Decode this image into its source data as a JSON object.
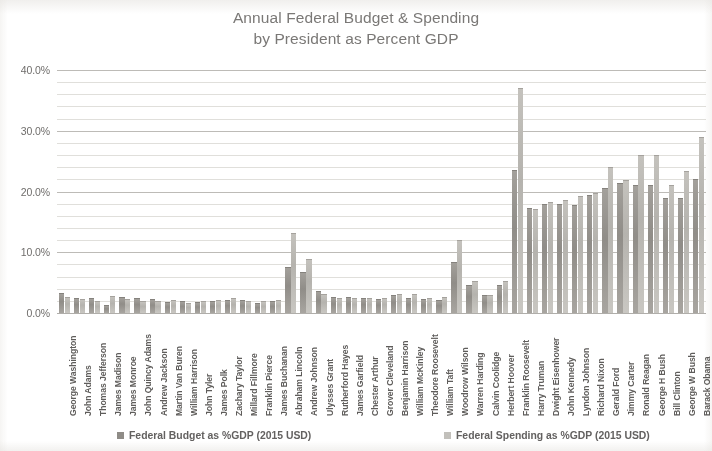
{
  "title": {
    "line1": "Annual Federal Budget & Spending",
    "line2": "by  President as Percent GDP"
  },
  "legend": {
    "budget_label": "Federal Budget as %GDP (2015 USD)",
    "spending_label": "Federal Spending as %GDP (2015 USD)"
  },
  "axis": {
    "y_ticks": [
      "0.0%",
      "10.0%",
      "20.0%",
      "30.0%",
      "40.0%"
    ]
  },
  "colors": {
    "budget_bar": "#908d88",
    "spending_bar": "#c2c0bb",
    "gridline": "#c9c7c3",
    "text": "#6e6e6e"
  },
  "chart_data": {
    "type": "bar",
    "title": "Annual Federal Budget & Spending by  President as Percent GDP",
    "xlabel": "",
    "ylabel": "",
    "ylim": [
      0,
      40
    ],
    "ytick_interval": 10,
    "minor_gridline_interval": 2,
    "grid": true,
    "legend_position": "bottom",
    "value_unit": "percent",
    "categories": [
      "George Washington",
      "John Adams",
      "Thomas Jefferson",
      "James Madison",
      "James Monroe",
      "John Quincy Adams",
      "Andrew Jackson",
      "Martin Van Buren",
      "William Harrison",
      "John Tyler",
      "James Polk",
      "Zachary Taylor",
      "Millard Fillmore",
      "Franklin Pierce",
      "James Buchanan",
      "Abraham Lincoln",
      "Andrew Johnson",
      "Ulysses Grant",
      "Rutherford Hayes",
      "James Garfield",
      "Chester Arthur",
      "Grover Cleveland",
      "Benjamin Harrison",
      "William McKinley",
      "Theodore Roosevelt",
      "William Taft",
      "Woodrow Wilson",
      "Warren Harding",
      "Calvin Coolidge",
      "Herbert Hoover",
      "Franklin Roosevelt",
      "Harry Truman",
      "Dwight Eisenhower",
      "John Kennedy",
      "Lyndon Johnson",
      "Richard Nixon",
      "Gerald Ford",
      "Jimmy Carter",
      "Ronald Reagan",
      "George H Bush",
      "Bill Clinton",
      "George W Bush",
      "Barack Obama"
    ],
    "series": [
      {
        "name": "Federal Budget as %GDP (2015 USD)",
        "values": [
          3.3,
          2.4,
          2.4,
          1.4,
          2.6,
          2.4,
          2.3,
          1.8,
          2.0,
          1.8,
          1.9,
          2.1,
          2.1,
          1.6,
          1.9,
          7.5,
          6.8,
          3.6,
          2.7,
          2.6,
          2.5,
          2.3,
          2.9,
          2.5,
          2.3,
          2.2,
          8.4,
          4.6,
          3.0,
          4.6,
          23.5,
          17.3,
          18.0,
          17.9,
          17.8,
          19.5,
          20.5,
          21.4,
          21.0,
          21.1,
          18.9,
          18.9,
          22.0
        ]
      },
      {
        "name": "Federal Spending as %GDP (2015 USD)",
        "values": [
          2.6,
          2.3,
          1.9,
          2.8,
          2.3,
          2.0,
          1.9,
          2.1,
          1.7,
          2.0,
          2.1,
          2.4,
          1.9,
          1.9,
          2.2,
          13.2,
          8.9,
          3.1,
          2.4,
          2.5,
          2.4,
          2.4,
          3.1,
          3.2,
          2.4,
          2.6,
          12.1,
          5.2,
          2.9,
          5.3,
          37.0,
          17.2,
          18.2,
          18.6,
          19.3,
          19.8,
          24.0,
          21.9,
          26.0,
          26.0,
          21.0,
          23.3,
          29.0
        ]
      }
    ]
  }
}
